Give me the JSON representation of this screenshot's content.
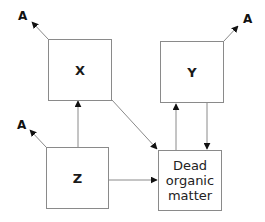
{
  "diagram": {
    "nodes": [
      {
        "id": "X",
        "label": "X"
      },
      {
        "id": "Y",
        "label": "Y"
      },
      {
        "id": "Z",
        "label": "Z"
      },
      {
        "id": "DOM",
        "label": "Dead\norganic\nmatter"
      }
    ],
    "outputs": [
      {
        "from": "X",
        "label": "A"
      },
      {
        "from": "Y",
        "label": "A"
      },
      {
        "from": "Z",
        "label": "A"
      }
    ],
    "edges": [
      {
        "from": "Z",
        "to": "X"
      },
      {
        "from": "Z",
        "to": "DOM"
      },
      {
        "from": "X",
        "to": "DOM"
      },
      {
        "from": "DOM",
        "to": "Y"
      },
      {
        "from": "Y",
        "to": "DOM"
      }
    ],
    "colors": {
      "line": "#8a8a8a",
      "arrowhead": "#111111",
      "text": "#1a1a1a"
    }
  }
}
